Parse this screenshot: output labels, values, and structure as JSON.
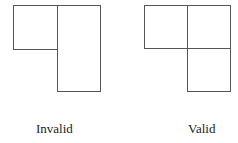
{
  "figures": [
    {
      "label": "Invalid"
    },
    {
      "label": "Valid"
    }
  ]
}
